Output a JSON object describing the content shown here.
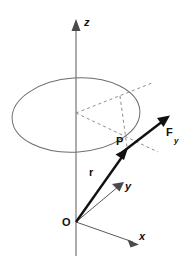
{
  "figure": {
    "background_color": "#ffffff",
    "width": 189,
    "height": 259
  },
  "colors": {
    "axis": "#5a5a5a",
    "ellipse": "#6d6d6d",
    "dashed": "#8d8d8d",
    "vector": "#111111",
    "label": "#111111"
  },
  "labels": {
    "origin": "O",
    "x_axis": "x",
    "y_axis": "y",
    "z_axis": "z",
    "point": "P",
    "position_vector": "r",
    "force_vector": "F",
    "force_subscript": "y"
  },
  "elements": {
    "ellipse": {
      "name": "circular-path",
      "center_x": 76,
      "center_y": 115,
      "radius_x": 64,
      "radius_y": 37,
      "rotation_deg": -4
    },
    "z_axis": {
      "from": [
        76,
        255
      ],
      "to": [
        76,
        22
      ]
    },
    "x_axis": {
      "from": [
        76,
        222
      ],
      "to": [
        138,
        244
      ]
    },
    "y_axis": {
      "from": [
        76,
        222
      ],
      "to": [
        124,
        182
      ]
    },
    "r_vector": {
      "from": [
        76,
        222
      ],
      "to": [
        126,
        152
      ]
    },
    "f_vector": {
      "from": [
        118,
        155
      ],
      "to": [
        170,
        116
      ]
    },
    "dashed_up_right": {
      "from": [
        76,
        113
      ],
      "to": [
        152,
        83
      ]
    },
    "dashed_down_right": {
      "from": [
        76,
        113
      ],
      "to": [
        158,
        152
      ]
    },
    "dashed_top_to_p": {
      "from": [
        120,
        96
      ],
      "to": [
        128,
        146
      ]
    }
  }
}
